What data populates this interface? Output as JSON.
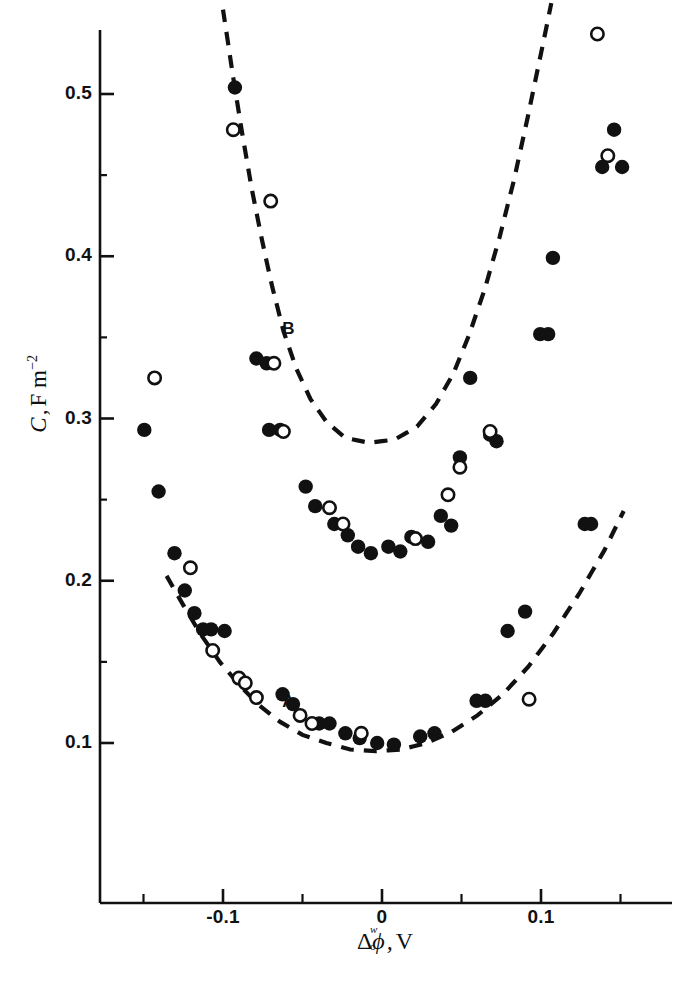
{
  "figure": {
    "background_color": "#ffffff",
    "ink_color": "#111111"
  },
  "axes": {
    "y_title_symbol": "C",
    "y_title_comma": ",",
    "y_title_unit": "F m",
    "y_title_exponent": "−2",
    "x_title_delta": "Δ",
    "x_title_superscript": "w",
    "x_title_subscript": "o",
    "x_title_phi": "ϕ",
    "x_title_comma": ",",
    "x_title_unit": "V",
    "y_ticks": [
      "0.1",
      "0.2",
      "0.3",
      "0.4",
      "0.5"
    ],
    "x_ticks": [
      "-0.1",
      "0",
      "0.1"
    ]
  },
  "curve_labels": {
    "a": "A",
    "b": "B"
  },
  "chart_data": {
    "type": "scatter",
    "title": "",
    "xlabel": "Δ(o,w) ϕ, V",
    "ylabel": "C, F m^-2",
    "xlim": [
      -0.165,
      0.155
    ],
    "ylim": [
      0.06,
      0.555
    ],
    "xticks": [
      -0.1,
      0.0,
      0.1
    ],
    "xtick_labels": [
      "-0.1",
      "0",
      "0.1"
    ],
    "x_minor_ticks": [
      -0.15,
      -0.05,
      0.05,
      0.15
    ],
    "yticks": [
      0.1,
      0.2,
      0.3,
      0.4,
      0.5
    ],
    "ytick_labels": [
      "0.1",
      "0.2",
      "0.3",
      "0.4",
      "0.5"
    ],
    "grid": false,
    "legend": "none",
    "annotations": [
      {
        "text": "A",
        "x": -0.059,
        "y": 0.125
      },
      {
        "text": "B",
        "x": -0.059,
        "y": 0.355
      }
    ],
    "series": [
      {
        "name": "filled-circles",
        "marker": "filled-circle",
        "points": [
          [
            -0.1495,
            0.293
          ],
          [
            -0.1405,
            0.255
          ],
          [
            -0.1305,
            0.217
          ],
          [
            -0.124,
            0.194
          ],
          [
            -0.118,
            0.18
          ],
          [
            -0.1125,
            0.17
          ],
          [
            -0.1075,
            0.17
          ],
          [
            -0.099,
            0.169
          ],
          [
            -0.0925,
            0.504
          ],
          [
            -0.079,
            0.337
          ],
          [
            -0.0725,
            0.334
          ],
          [
            -0.071,
            0.293
          ],
          [
            -0.064,
            0.293
          ],
          [
            -0.0625,
            0.13
          ],
          [
            -0.056,
            0.124
          ],
          [
            -0.048,
            0.258
          ],
          [
            -0.042,
            0.246
          ],
          [
            -0.0395,
            0.112
          ],
          [
            -0.033,
            0.112
          ],
          [
            -0.03,
            0.235
          ],
          [
            -0.023,
            0.106
          ],
          [
            -0.0215,
            0.228
          ],
          [
            -0.015,
            0.221
          ],
          [
            -0.014,
            0.103
          ],
          [
            -0.007,
            0.217
          ],
          [
            -0.003,
            0.1
          ],
          [
            0.004,
            0.221
          ],
          [
            0.0075,
            0.099
          ],
          [
            0.0115,
            0.218
          ],
          [
            0.0185,
            0.227
          ],
          [
            0.024,
            0.104
          ],
          [
            0.029,
            0.224
          ],
          [
            0.033,
            0.106
          ],
          [
            0.037,
            0.24
          ],
          [
            0.0435,
            0.234
          ],
          [
            0.049,
            0.276
          ],
          [
            0.0555,
            0.325
          ],
          [
            0.0595,
            0.126
          ],
          [
            0.065,
            0.126
          ],
          [
            0.068,
            0.29
          ],
          [
            0.072,
            0.286
          ],
          [
            0.079,
            0.169
          ],
          [
            0.09,
            0.181
          ],
          [
            0.0995,
            0.352
          ],
          [
            0.1045,
            0.352
          ],
          [
            0.1075,
            0.399
          ],
          [
            0.1275,
            0.235
          ],
          [
            0.1315,
            0.235
          ],
          [
            0.1385,
            0.455
          ],
          [
            0.146,
            0.478
          ],
          [
            0.151,
            0.455
          ]
        ]
      },
      {
        "name": "open-circles",
        "marker": "open-circle",
        "points": [
          [
            -0.143,
            0.325
          ],
          [
            -0.1205,
            0.208
          ],
          [
            -0.1065,
            0.157
          ],
          [
            -0.0935,
            0.478
          ],
          [
            -0.09,
            0.14
          ],
          [
            -0.086,
            0.137
          ],
          [
            -0.079,
            0.128
          ],
          [
            -0.07,
            0.434
          ],
          [
            -0.068,
            0.334
          ],
          [
            -0.062,
            0.292
          ],
          [
            -0.0515,
            0.117
          ],
          [
            -0.044,
            0.112
          ],
          [
            -0.033,
            0.245
          ],
          [
            -0.0245,
            0.235
          ],
          [
            -0.013,
            0.106
          ],
          [
            0.021,
            0.226
          ],
          [
            0.0415,
            0.253
          ],
          [
            0.049,
            0.27
          ],
          [
            0.068,
            0.292
          ],
          [
            0.0925,
            0.127
          ],
          [
            0.1355,
            0.537
          ],
          [
            0.142,
            0.462
          ]
        ]
      }
    ],
    "fit_curves": [
      {
        "name": "A",
        "style": "dashed",
        "label": "A",
        "points": [
          [
            -0.1355,
            0.203
          ],
          [
            -0.125,
            0.185
          ],
          [
            -0.114,
            0.167
          ],
          [
            -0.102,
            0.15
          ],
          [
            -0.09,
            0.136
          ],
          [
            -0.077,
            0.123
          ],
          [
            -0.064,
            0.113
          ],
          [
            -0.05,
            0.105
          ],
          [
            -0.035,
            0.1
          ],
          [
            -0.02,
            0.096
          ],
          [
            -0.004,
            0.095
          ],
          [
            0.012,
            0.096
          ],
          [
            0.028,
            0.1
          ],
          [
            0.044,
            0.107
          ],
          [
            0.06,
            0.117
          ],
          [
            0.076,
            0.13
          ],
          [
            0.092,
            0.147
          ],
          [
            0.108,
            0.168
          ],
          [
            0.124,
            0.192
          ],
          [
            0.14,
            0.219
          ],
          [
            0.152,
            0.243
          ]
        ]
      },
      {
        "name": "B",
        "style": "dashed",
        "label": "B",
        "points": [
          [
            -0.1,
            0.552
          ],
          [
            -0.094,
            0.513
          ],
          [
            -0.088,
            0.476
          ],
          [
            -0.082,
            0.442
          ],
          [
            -0.0755,
            0.41
          ],
          [
            -0.069,
            0.381
          ],
          [
            -0.062,
            0.354
          ],
          [
            -0.054,
            0.331
          ],
          [
            -0.045,
            0.312
          ],
          [
            -0.035,
            0.298
          ],
          [
            -0.023,
            0.288
          ],
          [
            -0.008,
            0.285
          ],
          [
            0.008,
            0.287
          ],
          [
            0.022,
            0.295
          ],
          [
            0.034,
            0.309
          ],
          [
            0.045,
            0.328
          ],
          [
            0.055,
            0.352
          ],
          [
            0.065,
            0.381
          ],
          [
            0.074,
            0.412
          ],
          [
            0.083,
            0.447
          ],
          [
            0.0915,
            0.485
          ],
          [
            0.1,
            0.525
          ],
          [
            0.1065,
            0.556
          ]
        ]
      }
    ]
  }
}
